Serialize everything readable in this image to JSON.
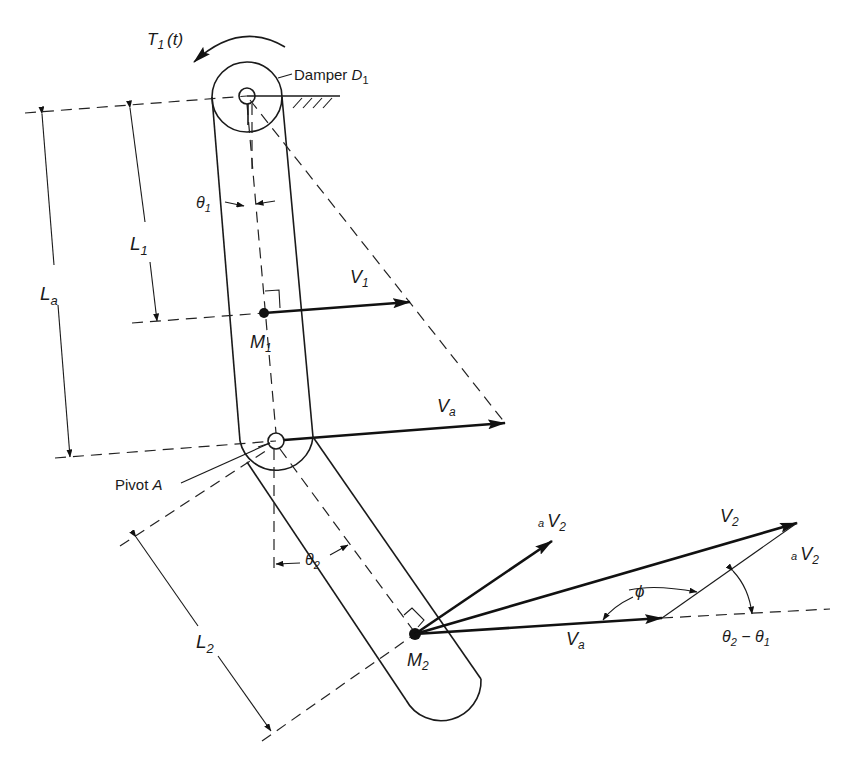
{
  "figure": {
    "type": "two-link pendulum / manipulator kinematics diagram",
    "background": "#ffffff",
    "ink": "#1a1a1a"
  },
  "labels": {
    "torque": "T",
    "torque_sub": "1",
    "torque_arg": "(t)",
    "damper": "Damper ",
    "damper_sym": "D",
    "damper_sub": "1",
    "theta1": "θ",
    "theta1_sub": "1",
    "L1": "L",
    "L1_sub": "1",
    "La": "L",
    "La_sub": "a",
    "V1": "V",
    "V1_sub": "1",
    "M1": "M",
    "M1_sub": "1",
    "Va_upper": "V",
    "Va_upper_sub": "a",
    "pivot": "Pivot ",
    "pivot_sym": "A",
    "theta2": "θ",
    "theta2_sub": "2",
    "L2": "L",
    "L2_sub": "2",
    "M2": "M",
    "M2_sub": "2",
    "aV2_left_pre": "a",
    "aV2_left": "V",
    "aV2_left_sub": "2",
    "V2": "V",
    "V2_sub": "2",
    "aV2_right_pre": "a",
    "aV2_right": "V",
    "aV2_right_sub": "2",
    "phi": "ϕ",
    "Va_lower": "V",
    "Va_lower_sub": "a",
    "angle_diff_a": "θ",
    "angle_diff_a_sub": "2",
    "angle_diff_op": " − ",
    "angle_diff_b": "θ",
    "angle_diff_b_sub": "1"
  },
  "geometry": {
    "upper_pivot": {
      "x": 247,
      "y": 96
    },
    "damper_radius": 35,
    "M1": {
      "x": 264,
      "y": 313
    },
    "pivot_A": {
      "x": 276,
      "y": 441
    },
    "M2": {
      "x": 415,
      "y": 634
    },
    "V1_tip": {
      "x": 410,
      "y": 302
    },
    "Va_upper_tip": {
      "x": 505,
      "y": 423
    },
    "aV2_tip": {
      "x": 552,
      "y": 541
    },
    "V2_tip": {
      "x": 797,
      "y": 523
    },
    "Va_lower_tip": {
      "x": 662,
      "y": 618
    }
  }
}
